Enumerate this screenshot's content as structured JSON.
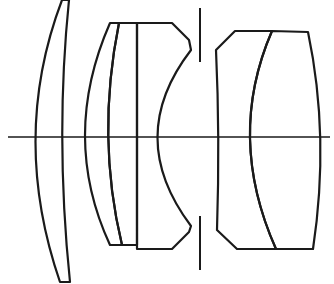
{
  "diagram": {
    "type": "optical-lens-layout",
    "stroke_color": "#1a1a1a",
    "background_color": "#ffffff",
    "stroke_width": 2.2,
    "optical_axis": {
      "y": 137,
      "x_start": 8,
      "x_end": 330,
      "stroke_width": 1.3
    },
    "aperture_stop": {
      "x": 200,
      "upper": [
        8,
        62
      ],
      "lower": [
        216,
        270
      ]
    },
    "elements": [
      {
        "name": "front-meniscus-element",
        "path": "M62,0 Q10,137 60,282 L70,282 Q55,137 69,0 Z"
      },
      {
        "name": "second-group-element-a",
        "path": "M110,23 Q60,137 110,245 L122,245 Q96,137 119,23 Z"
      },
      {
        "name": "second-group-element-b",
        "path": "M119,23 Q96,137 122,245 L137,245 L137,23 Z"
      },
      {
        "name": "second-group-element-c",
        "path": "M137,23 L172,23 L189,40 L191,50 Q124,137 191,226 L189,232 L172,249 L137,249 Z"
      },
      {
        "name": "rear-group-element-a",
        "path": "M216,50 L235,31 L272,31 Q226,137 276,249 L237,249 L217,230 Q220,137 216,50 Z"
      },
      {
        "name": "rear-group-element-b",
        "path": "M272,31 L308,32 Q330,137 313,249 L276,249 Q226,137 272,31 Z"
      }
    ]
  }
}
